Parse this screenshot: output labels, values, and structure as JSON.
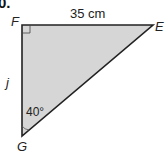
{
  "question_number": "0.",
  "triangle": {
    "vertices": {
      "F": "F",
      "E": "E",
      "G": "G"
    },
    "side_FE": "35 cm",
    "side_FG": "j",
    "angle_G": "40°",
    "right_angle_at": "F",
    "fill_color": "#d6d6d6",
    "stroke_color": "#222222"
  }
}
